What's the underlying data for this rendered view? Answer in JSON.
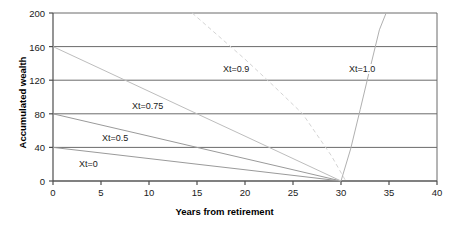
{
  "chart_data": {
    "type": "line",
    "title": "",
    "xlabel": "Years from retirement",
    "ylabel": "Accumulated wealth",
    "xlim": [
      0,
      40
    ],
    "ylim": [
      0,
      200
    ],
    "xticks": [
      0,
      5,
      10,
      15,
      20,
      25,
      30,
      35,
      40
    ],
    "xtick_labels": [
      "0",
      "5",
      "10",
      "15",
      "20",
      "25",
      "30",
      "35",
      "40"
    ],
    "yticks": [
      0,
      40,
      80,
      120,
      160,
      200
    ],
    "ytick_labels": [
      "0",
      "40",
      "80",
      "120",
      "160",
      "200"
    ],
    "grid": "horizontal",
    "legend_position": "inline-annotations",
    "series": [
      {
        "name": "Xt=0",
        "label": "Xt=0",
        "style": "solid",
        "color": "#9a9a9a",
        "x": [
          0,
          5,
          10,
          15,
          20,
          25,
          30
        ],
        "y": [
          40,
          33.4,
          26.7,
          20.0,
          13.4,
          6.7,
          0
        ]
      },
      {
        "name": "Xt=0.5",
        "label": "Xt=0.5",
        "style": "solid",
        "color": "#9a9a9a",
        "x": [
          0,
          5,
          10,
          15,
          20,
          25,
          30
        ],
        "y": [
          80,
          66.7,
          53.4,
          40.0,
          26.7,
          13.4,
          0
        ]
      },
      {
        "name": "Xt=0.75",
        "label": "Xt=0.75",
        "style": "solid",
        "color": "#bdbdbd",
        "x": [
          0,
          5,
          10,
          15,
          20,
          25,
          30
        ],
        "y": [
          160,
          133.4,
          106.7,
          80.0,
          53.4,
          26.7,
          0
        ]
      },
      {
        "name": "Xt=0.9",
        "label": "Xt=0.9",
        "style": "dashed",
        "color": "#d4d4d4",
        "x": [
          14.5,
          17,
          20,
          23,
          26,
          29,
          30.5
        ],
        "y": [
          200,
          175,
          145,
          113,
          80,
          30,
          0
        ]
      },
      {
        "name": "Xt=1.0",
        "label": "Xt=1.0",
        "style": "solid",
        "color": "#b0b0b0",
        "x": [
          30,
          31,
          32,
          33,
          34,
          34.7
        ],
        "y": [
          0,
          38,
          85,
          133,
          180,
          200
        ]
      }
    ],
    "annotations": [
      {
        "text": "Xt=0.9",
        "x_px": 222,
        "y_px": 64
      },
      {
        "text": "Xt=1.0",
        "x_px": 348,
        "y_px": 64
      },
      {
        "text": "Xt=0.75",
        "x_px": 131,
        "y_px": 101
      },
      {
        "text": "Xt=0.5",
        "x_px": 101,
        "y_px": 133
      },
      {
        "text": "Xt=0",
        "x_px": 78,
        "y_px": 159
      }
    ],
    "colors": {
      "axis": "#4d4d4d",
      "gridline": "#6b6b6b",
      "background": "#ffffff",
      "text": "#1a1a1a"
    }
  }
}
